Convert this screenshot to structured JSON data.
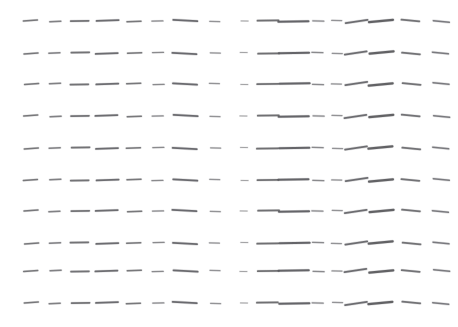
{
  "figure": {
    "title": "",
    "background_color": "#ffffff",
    "width": 458,
    "height": 327
  },
  "chart_data": {
    "type": "scatter",
    "subtype": "quiver-vector-field",
    "title": "",
    "subtitle": "",
    "xlabel": "",
    "ylabel": "",
    "grid": false,
    "legend": null,
    "axes_visible": false,
    "tick_labels_x": [],
    "tick_labels_y": [],
    "xlim": [
      0,
      458
    ],
    "ylim": [
      0,
      327
    ],
    "glyph_style": {
      "color": "#5a5a5e",
      "linewidth": 1.6,
      "linecap": "round",
      "shape": "line-segment"
    },
    "rows": 10,
    "columns": 17,
    "row_centers_y": [
      21,
      53,
      84,
      116,
      148,
      180,
      211,
      243,
      271,
      303
    ],
    "column_centers_x": [
      31,
      55,
      80,
      107,
      134,
      158,
      185,
      215,
      244,
      268,
      294,
      318,
      337,
      356,
      381,
      411,
      441
    ],
    "column_lengths": [
      14,
      11,
      18,
      22,
      14,
      11,
      24,
      10,
      7,
      21,
      30,
      11,
      10,
      22,
      24,
      18,
      16
    ],
    "column_angles_deg": [
      -4,
      -2,
      -1,
      -2,
      -2,
      -1,
      3,
      2,
      1,
      -1,
      -1,
      2,
      1,
      -8,
      -5,
      5,
      6
    ],
    "column_thickness": [
      1.5,
      1.5,
      1.6,
      1.8,
      1.5,
      1.3,
      1.9,
      1.2,
      1.0,
      1.7,
      2.1,
      1.3,
      1.2,
      1.8,
      2.2,
      1.7,
      1.5
    ],
    "column_opacity": [
      0.78,
      0.72,
      0.82,
      0.86,
      0.78,
      0.66,
      0.88,
      0.6,
      0.5,
      0.84,
      0.92,
      0.66,
      0.6,
      0.86,
      0.94,
      0.82,
      0.76
    ]
  }
}
